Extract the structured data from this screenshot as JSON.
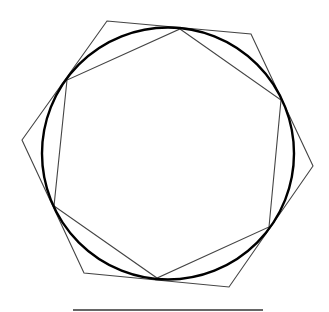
{
  "diagram": {
    "title": "",
    "shapes": [
      {
        "name": "circle",
        "role": "reference circle",
        "stroke": "#000000"
      },
      {
        "name": "inscribed-hexagon",
        "sides": 6,
        "stroke": "#444444"
      },
      {
        "name": "circumscribed-hexagon",
        "sides": 6,
        "stroke": "#444444"
      },
      {
        "name": "baseline-segment",
        "stroke": "#333333"
      }
    ],
    "labels": []
  }
}
